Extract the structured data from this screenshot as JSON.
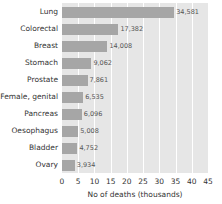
{
  "chart_data": {
    "type": "bar",
    "orientation": "horizontal",
    "title": "",
    "xlabel": "No of deaths (thousands)",
    "ylabel": "",
    "xlim": [
      0,
      45
    ],
    "xticks": [
      0,
      5,
      10,
      15,
      20,
      25,
      30,
      35,
      40,
      45
    ],
    "grid": true,
    "legend": null,
    "categories": [
      "Lung",
      "Colorectal",
      "Breast",
      "Stomach",
      "Prostate",
      "Female, genital",
      "Pancreas",
      "Oesophagus",
      "Bladder",
      "Ovary"
    ],
    "values": [
      34.581,
      17.382,
      14.008,
      9.062,
      7.861,
      6.535,
      6.096,
      5.008,
      4.752,
      3.934
    ],
    "value_labels": [
      "34,581",
      "17,382",
      "14,008",
      "9,062",
      "7,861",
      "6,535",
      "6,096",
      "5,008",
      "4,752",
      "3,934"
    ],
    "colors": {
      "bar": "#a6a6a6",
      "plot_background": "#e6e6e6",
      "grid": "#ffffff"
    }
  }
}
